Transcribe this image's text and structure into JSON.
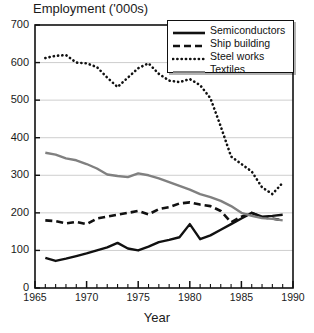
{
  "chart_data": {
    "type": "line",
    "title": "Employment ('000s)",
    "xlabel": "Year",
    "ylabel": "",
    "xlim": [
      1965,
      1990
    ],
    "ylim": [
      0,
      700
    ],
    "xticks": [
      1965,
      1970,
      1975,
      1980,
      1985,
      1990
    ],
    "yticks": [
      0,
      100,
      200,
      300,
      400,
      500,
      600,
      700
    ],
    "grid": "horizontal",
    "legend_position": "top-right",
    "x": [
      1966,
      1967,
      1968,
      1969,
      1970,
      1971,
      1972,
      1973,
      1974,
      1975,
      1976,
      1977,
      1978,
      1979,
      1980,
      1981,
      1982,
      1983,
      1984,
      1985,
      1986,
      1987,
      1988,
      1989
    ],
    "series": [
      {
        "name": "Semiconductors",
        "style": "solid",
        "color": "#111111",
        "values": [
          80,
          72,
          78,
          85,
          92,
          100,
          108,
          120,
          105,
          100,
          110,
          122,
          128,
          135,
          170,
          130,
          140,
          155,
          170,
          185,
          200,
          190,
          192,
          195
        ]
      },
      {
        "name": "Ship building",
        "style": "dashed",
        "color": "#111111",
        "values": [
          180,
          178,
          172,
          176,
          170,
          185,
          190,
          195,
          200,
          205,
          196,
          210,
          215,
          225,
          228,
          222,
          218,
          205,
          175,
          190,
          200,
          188,
          185,
          180
        ]
      },
      {
        "name": "Steel works",
        "style": "dotted",
        "color": "#111111",
        "values": [
          612,
          618,
          620,
          600,
          598,
          588,
          560,
          535,
          560,
          585,
          598,
          570,
          552,
          548,
          556,
          540,
          505,
          430,
          350,
          330,
          310,
          268,
          250,
          280
        ]
      },
      {
        "name": "Textiles",
        "style": "solid",
        "color": "#808080",
        "values": [
          360,
          355,
          345,
          340,
          330,
          318,
          302,
          298,
          295,
          305,
          300,
          292,
          282,
          272,
          262,
          250,
          242,
          232,
          218,
          200,
          192,
          186,
          184,
          180
        ]
      }
    ]
  },
  "legend": {
    "items": [
      {
        "label": "Semiconductors"
      },
      {
        "label": "Ship building"
      },
      {
        "label": "Steel works"
      },
      {
        "label": "Textiles"
      }
    ]
  }
}
